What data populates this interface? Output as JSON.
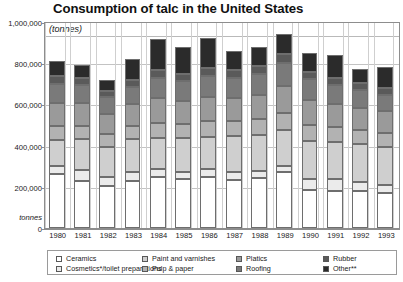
{
  "chart_data": {
    "type": "bar",
    "subtype": "stacked-bar",
    "title": "Consumption of talc in the United States",
    "units_label": "(tonnes)",
    "xlabel": "",
    "ylabel": "tonnes",
    "ylim": [
      0,
      1000000
    ],
    "yticks": [
      0,
      200000,
      400000,
      600000,
      800000,
      1000000
    ],
    "ytick_labels": [
      "0",
      "200,000",
      "400,000",
      "600,000",
      "800,000",
      "1,000,000"
    ],
    "grid": true,
    "legend_position": "bottom",
    "categories": [
      "1980",
      "1981",
      "1982",
      "1983",
      "1984",
      "1985",
      "1986",
      "1987",
      "1988",
      "1989",
      "1990",
      "1991",
      "1992",
      "1993"
    ],
    "series": [
      {
        "name": "Ceramics",
        "color": "#ffffff",
        "values": [
          262000,
          230000,
          206000,
          230000,
          248000,
          239000,
          246000,
          235000,
          245000,
          270000,
          186000,
          180000,
          180000,
          170000
        ]
      },
      {
        "name": "Cosmetics*/toilet preparations",
        "color": "#ebebeb",
        "values": [
          38000,
          52000,
          44000,
          43000,
          38000,
          33000,
          40000,
          37000,
          30000,
          30000,
          52000,
          56000,
          44000,
          38000
        ]
      },
      {
        "name": "Paint and varnishes",
        "color": "#cfcfcf",
        "values": [
          126000,
          150000,
          145000,
          160000,
          152000,
          165000,
          156000,
          173000,
          175000,
          178000,
          185000,
          182000,
          183000,
          186000
        ]
      },
      {
        "name": "Pulp & paper",
        "color": "#b2b2b2",
        "values": [
          70000,
          65000,
          60000,
          62000,
          73000,
          68000,
          76000,
          74000,
          78000,
          82000,
          78000,
          72000,
          70000,
          66000
        ]
      },
      {
        "name": "Platics",
        "color": "#9a9a9a",
        "values": [
          110000,
          108000,
          100000,
          105000,
          118000,
          112000,
          118000,
          112000,
          118000,
          128000,
          122000,
          110000,
          108000,
          106000
        ]
      },
      {
        "name": "Roofing",
        "color": "#7a7a7a",
        "values": [
          92000,
          88000,
          80000,
          86000,
          100000,
          95000,
          100000,
          96000,
          100000,
          112000,
          98000,
          92000,
          86000,
          82000
        ]
      },
      {
        "name": "Rubber",
        "color": "#5a5a5a",
        "values": [
          38000,
          35000,
          30000,
          33000,
          40000,
          38000,
          42000,
          38000,
          40000,
          45000,
          38000,
          36000,
          34000,
          32000
        ]
      },
      {
        "name": "Other**",
        "color": "#2b2b2b",
        "values": [
          74000,
          62000,
          55000,
          101000,
          151000,
          130000,
          142000,
          95000,
          94000,
          95000,
          91000,
          112000,
          65000,
          100000
        ]
      }
    ],
    "totals": [
      810000,
      790000,
      720000,
      820000,
      920000,
      880000,
      920000,
      860000,
      880000,
      940000,
      850000,
      840000,
      770000,
      780000
    ]
  },
  "legend": {
    "items": [
      {
        "label": "Ceramics",
        "color": "#ffffff"
      },
      {
        "label": "Cosmetics*/toilet preparations",
        "color": "#ebebeb"
      },
      {
        "label": "Paint and varnishes",
        "color": "#cfcfcf"
      },
      {
        "label": "Pulp & paper",
        "color": "#b2b2b2"
      },
      {
        "label": "Platics",
        "color": "#9a9a9a"
      },
      {
        "label": "Roofing",
        "color": "#7a7a7a"
      },
      {
        "label": "Rubber",
        "color": "#5a5a5a"
      },
      {
        "label": "Other**",
        "color": "#2b2b2b"
      }
    ]
  },
  "colors": {
    "frame": "#8d8d8d",
    "grid": "#c3c3c3",
    "text": "#1a1a1a",
    "background": "#ffffff"
  }
}
